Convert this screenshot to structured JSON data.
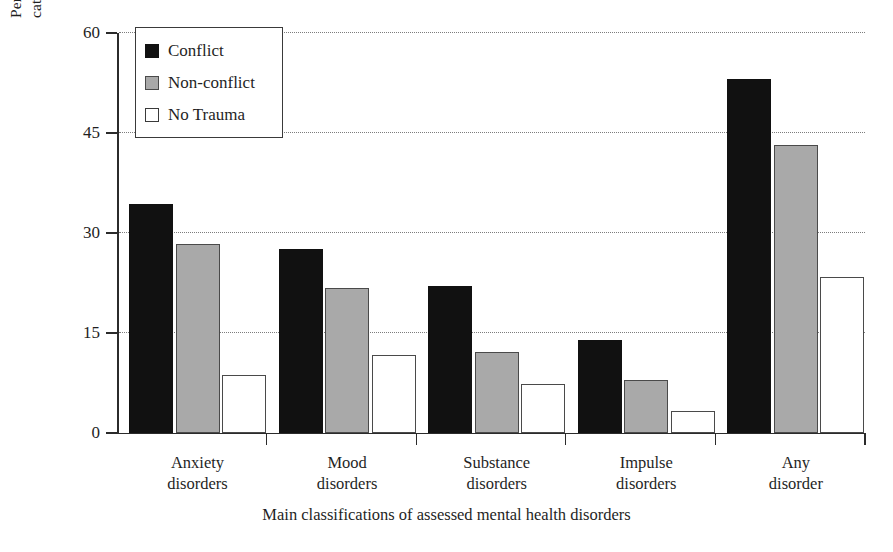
{
  "chart_data": {
    "type": "bar",
    "title": "",
    "xlabel": "Main classifications of assessed mental health disorders",
    "ylabel_line1": "Percentage of respondents in each trauma",
    "ylabel_line2": "category meeting the criteria for disorders",
    "categories": [
      "Anxiety\ndisorders",
      "Mood\ndisorders",
      "Substance\ndisorders",
      "Impulse\ndisorders",
      "Any\ndisorder"
    ],
    "category_lines": [
      [
        "Anxiety",
        "disorders"
      ],
      [
        "Mood",
        "disorders"
      ],
      [
        "Substance",
        "disorders"
      ],
      [
        "Impulse",
        "disorders"
      ],
      [
        "Any",
        "disorder"
      ]
    ],
    "series": [
      {
        "name": "Conflict",
        "color": "#111111",
        "values": [
          34.3,
          27.6,
          22.0,
          14.0,
          53.1
        ]
      },
      {
        "name": "Non-conflict",
        "color": "#a9a9a9",
        "values": [
          28.4,
          21.7,
          12.2,
          8.0,
          43.2
        ]
      },
      {
        "name": "No Trauma",
        "color": "#ffffff",
        "values": [
          8.7,
          11.7,
          7.3,
          3.3,
          23.4
        ]
      }
    ],
    "ylim": [
      0,
      60
    ],
    "yticks": [
      0,
      15,
      30,
      45,
      60
    ],
    "ytick_labels": [
      "0",
      "15",
      "30",
      "45",
      "60"
    ],
    "grid": "horizontal-dotted",
    "legend_position": "upper-left-inside",
    "legend_entries": [
      "Conflict",
      "Non-conflict",
      "No Trauma"
    ]
  }
}
